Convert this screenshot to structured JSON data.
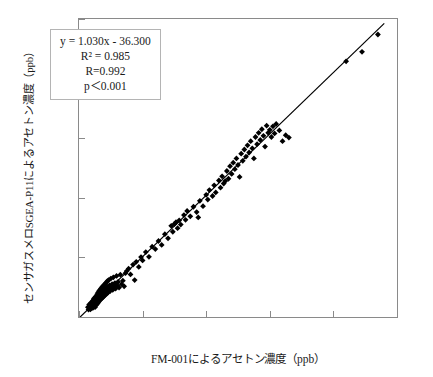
{
  "chart_data": {
    "type": "scatter",
    "title": "",
    "xlabel": "FM-001によるアセトン濃度（ppb）",
    "ylabel": "センサガスメロSGEA-P11によるアセトン濃度（ppb）",
    "xlim": [
      0,
      10000
    ],
    "ylim": [
      0,
      10000
    ],
    "xticks": [
      "0",
      "2000",
      "4000",
      "6000",
      "8000",
      "10000"
    ],
    "yticks": [
      "0",
      "2000",
      "4000",
      "6000",
      "8000",
      "10000"
    ],
    "xtick_values": [
      0,
      2000,
      4000,
      6000,
      8000,
      10000
    ],
    "ytick_values": [
      0,
      2000,
      4000,
      6000,
      8000,
      10000
    ],
    "grid": false,
    "legend": false,
    "marker": "diamond",
    "marker_color": "#000000",
    "line_color": "#000000",
    "fit_line": {
      "slope": 1.03,
      "intercept": -36.3,
      "x_start": 0,
      "x_end": 9600
    },
    "annotations": {
      "equation": "y = 1.030x - 36.300",
      "r_squared": "R² = 0.985",
      "r": "R=0.992",
      "p_value": "p＜0.001"
    },
    "points": [
      [
        280,
        330
      ],
      [
        300,
        250
      ],
      [
        320,
        420
      ],
      [
        330,
        300
      ],
      [
        350,
        390
      ],
      [
        360,
        260
      ],
      [
        380,
        470
      ],
      [
        390,
        340
      ],
      [
        400,
        300
      ],
      [
        410,
        520
      ],
      [
        420,
        380
      ],
      [
        430,
        450
      ],
      [
        440,
        310
      ],
      [
        450,
        560
      ],
      [
        455,
        420
      ],
      [
        460,
        350
      ],
      [
        470,
        620
      ],
      [
        480,
        480
      ],
      [
        490,
        400
      ],
      [
        500,
        540
      ],
      [
        505,
        330
      ],
      [
        510,
        660
      ],
      [
        520,
        470
      ],
      [
        525,
        580
      ],
      [
        530,
        390
      ],
      [
        540,
        700
      ],
      [
        545,
        500
      ],
      [
        550,
        620
      ],
      [
        560,
        430
      ],
      [
        570,
        760
      ],
      [
        575,
        540
      ],
      [
        580,
        660
      ],
      [
        590,
        470
      ],
      [
        600,
        820
      ],
      [
        605,
        580
      ],
      [
        610,
        700
      ],
      [
        620,
        510
      ],
      [
        630,
        870
      ],
      [
        635,
        620
      ],
      [
        640,
        740
      ],
      [
        650,
        550
      ],
      [
        660,
        910
      ],
      [
        665,
        660
      ],
      [
        670,
        780
      ],
      [
        680,
        590
      ],
      [
        690,
        960
      ],
      [
        700,
        700
      ],
      [
        710,
        820
      ],
      [
        720,
        630
      ],
      [
        730,
        1010
      ],
      [
        740,
        740
      ],
      [
        750,
        860
      ],
      [
        760,
        670
      ],
      [
        770,
        1060
      ],
      [
        780,
        780
      ],
      [
        790,
        900
      ],
      [
        800,
        710
      ],
      [
        810,
        1100
      ],
      [
        820,
        820
      ],
      [
        830,
        940
      ],
      [
        840,
        750
      ],
      [
        850,
        1150
      ],
      [
        860,
        860
      ],
      [
        870,
        980
      ],
      [
        880,
        790
      ],
      [
        890,
        1200
      ],
      [
        900,
        900
      ],
      [
        910,
        1020
      ],
      [
        920,
        830
      ],
      [
        930,
        1240
      ],
      [
        950,
        940
      ],
      [
        960,
        1060
      ],
      [
        980,
        870
      ],
      [
        1000,
        1290
      ],
      [
        1010,
        980
      ],
      [
        1040,
        1100
      ],
      [
        1060,
        910
      ],
      [
        1080,
        1330
      ],
      [
        1100,
        1020
      ],
      [
        1130,
        1140
      ],
      [
        1150,
        950
      ],
      [
        1180,
        1380
      ],
      [
        1200,
        1060
      ],
      [
        1230,
        1180
      ],
      [
        1260,
        990
      ],
      [
        1300,
        1420
      ],
      [
        1340,
        1100
      ],
      [
        1380,
        1220
      ],
      [
        1420,
        1030
      ],
      [
        1460,
        1470
      ],
      [
        1500,
        1540
      ],
      [
        1560,
        1620
      ],
      [
        1620,
        1430
      ],
      [
        1700,
        1760
      ],
      [
        1750,
        1240
      ],
      [
        1800,
        1850
      ],
      [
        1880,
        1680
      ],
      [
        1950,
        2010
      ],
      [
        2000,
        1900
      ],
      [
        2100,
        2180
      ],
      [
        2200,
        2020
      ],
      [
        2300,
        2360
      ],
      [
        2400,
        2280
      ],
      [
        2500,
        2550
      ],
      [
        2600,
        2420
      ],
      [
        2700,
        2780
      ],
      [
        2800,
        2640
      ],
      [
        2900,
        3060
      ],
      [
        2950,
        2860
      ],
      [
        3000,
        3120
      ],
      [
        3050,
        3180
      ],
      [
        3100,
        2980
      ],
      [
        3150,
        3240
      ],
      [
        3200,
        3100
      ],
      [
        3300,
        3420
      ],
      [
        3350,
        3260
      ],
      [
        3400,
        3560
      ],
      [
        3500,
        3380
      ],
      [
        3600,
        3700
      ],
      [
        3700,
        3520
      ],
      [
        3750,
        3340
      ],
      [
        3800,
        3900
      ],
      [
        3900,
        3720
      ],
      [
        4000,
        4100
      ],
      [
        4050,
        3940
      ],
      [
        4100,
        4260
      ],
      [
        4200,
        4060
      ],
      [
        4250,
        4420
      ],
      [
        4300,
        4180
      ],
      [
        4400,
        4580
      ],
      [
        4450,
        4340
      ],
      [
        4500,
        4720
      ],
      [
        4550,
        4480
      ],
      [
        4600,
        4560
      ],
      [
        4650,
        4900
      ],
      [
        4700,
        4640
      ],
      [
        4750,
        5060
      ],
      [
        4800,
        4800
      ],
      [
        4850,
        5180
      ],
      [
        4900,
        4960
      ],
      [
        4950,
        5320
      ],
      [
        5000,
        5100
      ],
      [
        5050,
        4700
      ],
      [
        5100,
        5480
      ],
      [
        5150,
        5240
      ],
      [
        5200,
        5620
      ],
      [
        5250,
        5380
      ],
      [
        5300,
        5760
      ],
      [
        5350,
        5520
      ],
      [
        5400,
        5900
      ],
      [
        5450,
        5660
      ],
      [
        5500,
        5320
      ],
      [
        5550,
        6040
      ],
      [
        5600,
        5800
      ],
      [
        5650,
        6180
      ],
      [
        5700,
        5940
      ],
      [
        5750,
        6300
      ],
      [
        5800,
        6080
      ],
      [
        5850,
        5720
      ],
      [
        5900,
        6420
      ],
      [
        5950,
        6180
      ],
      [
        6000,
        6280
      ],
      [
        6050,
        6040
      ],
      [
        6100,
        6400
      ],
      [
        6150,
        6160
      ],
      [
        6200,
        6480
      ],
      [
        6300,
        6260
      ],
      [
        6400,
        5900
      ],
      [
        6500,
        6100
      ],
      [
        6600,
        6020
      ],
      [
        8400,
        8580
      ],
      [
        8900,
        8900
      ],
      [
        9400,
        9480
      ]
    ]
  }
}
